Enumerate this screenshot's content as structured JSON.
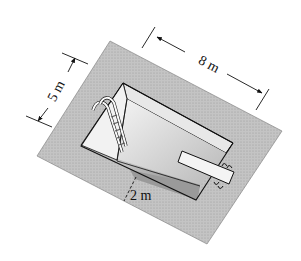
{
  "figure": {
    "colors": {
      "deck": "#bdbdbd",
      "deck_stroke": "#555555",
      "far_wall": "#e6e6e6",
      "left_wall": "#efefef",
      "floor": "#a9a9a9",
      "near_wall": "#8f8f8f",
      "board": "#f2f2f2",
      "line": "#111111"
    },
    "labels": {
      "width": "5 m",
      "length": "8 m",
      "depth": "2 m"
    },
    "dimensions": {
      "width_m": 5,
      "length_m": 8,
      "depth_m": 2
    }
  }
}
